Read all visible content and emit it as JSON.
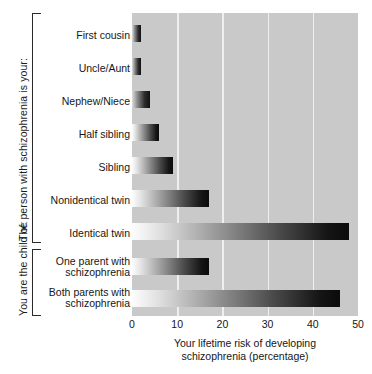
{
  "chart_data": {
    "type": "bar",
    "orientation": "horizontal",
    "title": "",
    "xlabel": "Your lifetime risk of developing schizophrenia (percentage)",
    "ylabel": "",
    "xlim": [
      0,
      50
    ],
    "xticks": [
      0,
      10,
      20,
      30,
      40,
      50
    ],
    "xtick_labels": [
      "0",
      "10",
      "20",
      "30",
      "40",
      "50"
    ],
    "grid": "vertical-gridlines-at-10-20-30-40",
    "legend": "none",
    "categories": [
      "First cousin",
      "Uncle/Aunt",
      "Nephew/Niece",
      "Half sibling",
      "Sibling",
      "Nonidentical twin",
      "Identical twin",
      "One parent with schizophrenia",
      "Both parents with schizophrenia"
    ],
    "values": [
      2,
      2,
      4,
      6,
      9,
      17,
      48,
      17,
      46
    ],
    "groups": [
      {
        "label": "The person with schizophrenia is your:",
        "category_indices": [
          0,
          1,
          2,
          3,
          4,
          5,
          6
        ]
      },
      {
        "label": "You are the child of:",
        "category_indices": [
          7,
          8
        ]
      }
    ]
  },
  "axis": {
    "x_title_line1": "Your lifetime risk of developing",
    "x_title_line2": "schizophrenia (percentage)",
    "tick_0": "0",
    "tick_10": "10",
    "tick_20": "20",
    "tick_30": "30",
    "tick_40": "40",
    "tick_50": "50"
  },
  "groups": {
    "person": "The person with schizophrenia is your:",
    "child": "You are the child of:"
  },
  "labels": {
    "first_cousin": "First cousin",
    "uncle_aunt": "Uncle/Aunt",
    "nephew_niece": "Nephew/Niece",
    "half_sibling": "Half sibling",
    "sibling": "Sibling",
    "nonidentical_twin": "Nonidentical twin",
    "identical_twin": "Identical twin",
    "one_parent_l1": "One parent with",
    "one_parent_l2": "schizophrenia",
    "both_parents_l1": "Both parents with",
    "both_parents_l2": "schizophrenia"
  },
  "colors": {
    "plot_background": "#c9c9c9",
    "gridline": "#efefef",
    "bar_gradient_start": "#fdfdfd",
    "bar_gradient_end": "#0b0b0b",
    "text": "#161616",
    "page_background": "#ffffff"
  }
}
